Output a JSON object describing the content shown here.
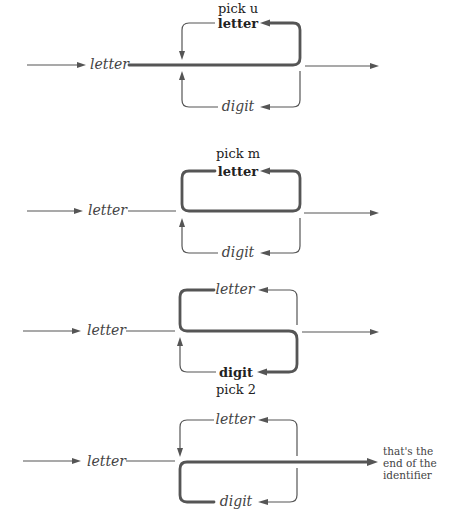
{
  "diagrams": [
    {
      "id": "step-1",
      "pick": "pick u",
      "pick_position": "above",
      "entry_label": "letter",
      "loop_top_label": "letter",
      "loop_top_bold": true,
      "loop_bottom_label": "digit",
      "loop_bottom_bold": false,
      "highlighted_path": "entry-then-top-loop"
    },
    {
      "id": "step-2",
      "pick": "pick m",
      "pick_position": "above",
      "entry_label": "letter",
      "loop_top_label": "letter",
      "loop_top_bold": true,
      "loop_bottom_label": "digit",
      "loop_bottom_bold": false,
      "highlighted_path": "top-loop-repeat"
    },
    {
      "id": "step-3",
      "pick": "pick 2",
      "pick_position": "below",
      "entry_label": "letter",
      "loop_top_label": "letter",
      "loop_top_bold": false,
      "loop_bottom_label": "digit",
      "loop_bottom_bold": true,
      "highlighted_path": "top-to-bottom-loop"
    },
    {
      "id": "step-4",
      "pick": "",
      "entry_label": "letter",
      "loop_top_label": "letter",
      "loop_top_bold": false,
      "loop_bottom_label": "digit",
      "loop_bottom_bold": false,
      "highlighted_path": "bottom-loop-then-exit",
      "exit_note": [
        "that's the",
        "end of the",
        "identifier"
      ]
    }
  ],
  "colors": {
    "line": "#555555",
    "text": "#444444"
  }
}
